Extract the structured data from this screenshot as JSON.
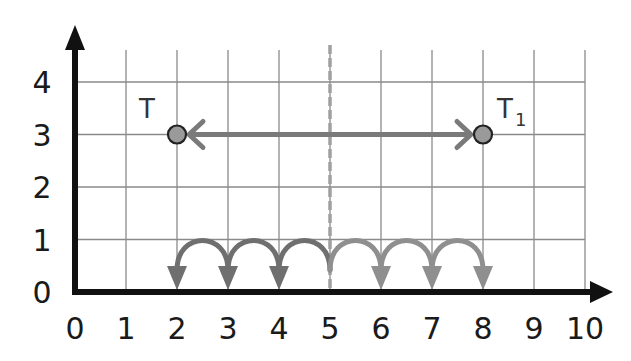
{
  "diagram": {
    "type": "coordinate-grid-translation",
    "x_axis": {
      "ticks": [
        "0",
        "1",
        "2",
        "3",
        "4",
        "5",
        "6",
        "7",
        "8",
        "9",
        "10"
      ],
      "range": [
        0,
        10
      ]
    },
    "y_axis": {
      "ticks": [
        "0",
        "1",
        "2",
        "3",
        "4"
      ],
      "range": [
        0,
        4
      ]
    },
    "points": [
      {
        "label": "T",
        "x": 2,
        "y": 3
      },
      {
        "label": "T",
        "subscript": "1",
        "x": 8,
        "y": 3
      }
    ],
    "translation_arrow": {
      "from": [
        2,
        3
      ],
      "to": [
        8,
        3
      ],
      "double_headed": true
    },
    "mirror_line": {
      "x": 5,
      "style": "dashed"
    },
    "jumps": {
      "left_group": {
        "start": 5,
        "end": 2,
        "count": 3,
        "direction": "left"
      },
      "right_group": {
        "start": 5,
        "end": 8,
        "count": 3,
        "direction": "right"
      }
    },
    "colors": {
      "axis": "#111111",
      "grid": "#8a8a8a",
      "arrow": "#7a7a7a",
      "point_fill": "#9a9a9a",
      "point_stroke": "#222222",
      "jumps_left": "#6f6f6f",
      "jumps_right": "#8f8f8f",
      "mirror_line": "#a0a0a0"
    }
  }
}
